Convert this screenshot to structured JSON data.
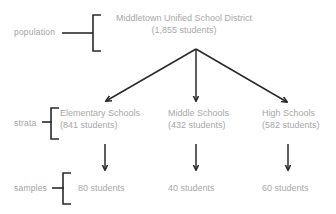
{
  "diagram": {
    "colors": {
      "background": "#ffffff",
      "content_text": "#a8a8a8",
      "row_label_text": "#a2a2a2",
      "line_art": "#2a2a2a"
    },
    "row_labels": {
      "population": "population",
      "strata": "strata",
      "samples": "samples"
    },
    "population": {
      "name": "Middletown Unified School District",
      "count": "(1,855 students)"
    },
    "strata": [
      {
        "name": "Elementary Schools",
        "count": "(841 students)"
      },
      {
        "name": "Middle Schools",
        "count": "(432 students)"
      },
      {
        "name": "High Schools",
        "count": "(582 students)"
      }
    ],
    "samples": [
      {
        "label": "80 students"
      },
      {
        "label": "40 students"
      },
      {
        "label": "60 students"
      }
    ]
  }
}
